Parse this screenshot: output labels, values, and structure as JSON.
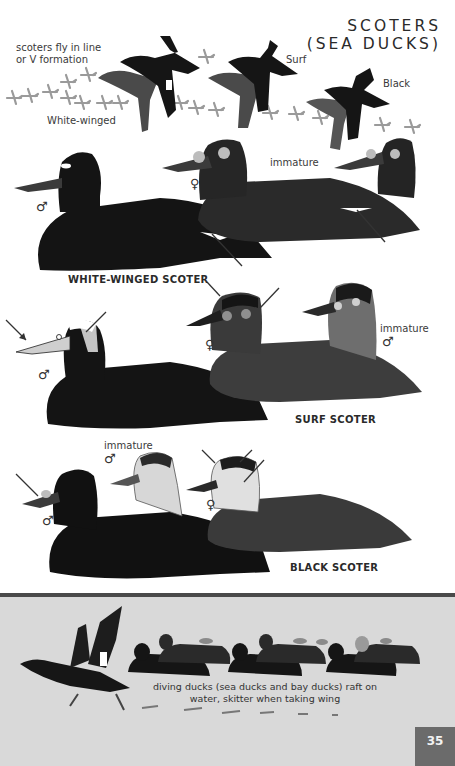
{
  "page": {
    "title_line1": "SCOTERS",
    "title_line2": "(SEA DUCKS)",
    "page_number": "35"
  },
  "flight": {
    "note_line1": "scoters fly in line",
    "note_line2": "or V formation",
    "labels": {
      "white_winged": "White-winged",
      "surf": "Surf",
      "black": "Black"
    }
  },
  "species": [
    {
      "id": "white-winged-scoter",
      "caption": "WHITE-WINGED SCOTER",
      "figures": [
        {
          "sex": "♂",
          "label": ""
        },
        {
          "sex": "♀",
          "label": ""
        },
        {
          "sex": "",
          "label": "immature"
        }
      ]
    },
    {
      "id": "surf-scoter",
      "caption": "SURF SCOTER",
      "figures": [
        {
          "sex": "♂",
          "label": ""
        },
        {
          "sex": "♀",
          "label": ""
        },
        {
          "sex": "♂",
          "label": "immature"
        }
      ]
    },
    {
      "id": "black-scoter",
      "caption": "BLACK SCOTER",
      "figures": [
        {
          "sex": "♂",
          "label": ""
        },
        {
          "sex": "♂",
          "label": "immature"
        },
        {
          "sex": "♀",
          "label": ""
        }
      ]
    }
  ],
  "behavior": {
    "caption_line1": "diving ducks (sea ducks and bay ducks) raft on",
    "caption_line2": "water, skitter when taking wing"
  },
  "colors": {
    "plate_background": "#ffffff",
    "bottom_panel": "#d9d9d9",
    "rule": "#4a4a4a",
    "page_tab": "#6b6b6b",
    "male_plumage": "#141414",
    "female_plumage": "#3d3d3d"
  }
}
